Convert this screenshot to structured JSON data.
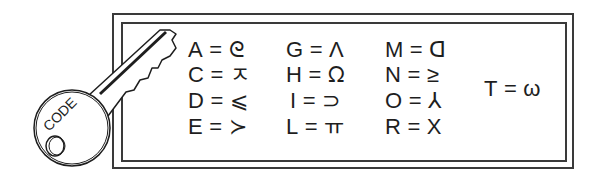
{
  "key": {
    "label": "CODE",
    "symbol": "O"
  },
  "columns": [
    [
      {
        "letter": "A",
        "eq": "=",
        "symbol": "ᘓ",
        "symbol_name": "loop-s"
      },
      {
        "letter": "C",
        "eq": "=",
        "symbol": "ㅈ",
        "symbol_name": "k-rotated"
      },
      {
        "letter": "D",
        "eq": "=",
        "symbol": "⩽",
        "symbol_name": "w-sideways"
      },
      {
        "letter": "E",
        "eq": "=",
        "symbol": "≻",
        "symbol_name": "y-sideways"
      }
    ],
    [
      {
        "letter": "G",
        "eq": "=",
        "symbol": "Λ",
        "symbol_name": "lambda"
      },
      {
        "letter": "H",
        "eq": "=",
        "symbol": "ᘯ",
        "symbol_name": "q-circle"
      },
      {
        "letter": "I",
        "eq": "=",
        "symbol": "⊃",
        "symbol_name": "u-sideways"
      },
      {
        "letter": "L",
        "eq": "=",
        "symbol": "ㅠ",
        "symbol_name": "f-rotated"
      }
    ],
    [
      {
        "letter": "M",
        "eq": "=",
        "symbol": "ᗡ",
        "symbol_name": "b-rotated"
      },
      {
        "letter": "N",
        "eq": "=",
        "symbol": "≥",
        "symbol_name": "z-sideways"
      },
      {
        "letter": "O",
        "eq": "=",
        "symbol": "⅄",
        "symbol_name": "y-inverted"
      },
      {
        "letter": "R",
        "eq": "=",
        "symbol": "X",
        "symbol_name": "x"
      }
    ],
    [
      {
        "letter": "T",
        "eq": "=",
        "symbol": "ω",
        "symbol_name": "b-rotated-flat"
      }
    ]
  ]
}
